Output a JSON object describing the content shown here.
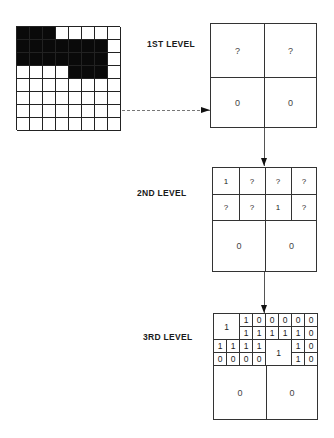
{
  "labels": {
    "level1": "1ST LEVEL",
    "level2": "2ND LEVEL",
    "level3": "3RD LEVEL"
  },
  "image_grid": {
    "rows": 8,
    "cols": 8,
    "pixels": [
      [
        1,
        1,
        1,
        0,
        0,
        0,
        0,
        0
      ],
      [
        1,
        1,
        1,
        1,
        1,
        1,
        1,
        0
      ],
      [
        1,
        1,
        1,
        1,
        1,
        1,
        1,
        0
      ],
      [
        0,
        0,
        0,
        0,
        1,
        1,
        1,
        0
      ],
      [
        0,
        0,
        0,
        0,
        0,
        0,
        0,
        0
      ],
      [
        0,
        0,
        0,
        0,
        0,
        0,
        0,
        0
      ],
      [
        0,
        0,
        0,
        0,
        0,
        0,
        0,
        0
      ],
      [
        0,
        0,
        0,
        0,
        0,
        0,
        0,
        0
      ]
    ]
  },
  "level1": {
    "cells": [
      "?",
      "?",
      "0",
      "0"
    ]
  },
  "level2": {
    "top": [
      [
        "1",
        "?",
        "?",
        "?"
      ],
      [
        "?",
        "?",
        "1",
        "?"
      ]
    ],
    "bottom": [
      "0",
      "0"
    ]
  },
  "level3": {
    "merged_top_left": "1",
    "merged_mid": "1",
    "q01": [
      [
        "1",
        "0"
      ],
      [
        "1",
        "1"
      ]
    ],
    "q02": [
      [
        "0",
        "0"
      ],
      [
        "1",
        "1"
      ]
    ],
    "q03": [
      [
        "0",
        "0"
      ],
      [
        "1",
        "0"
      ]
    ],
    "q10": [
      [
        "1",
        "1"
      ],
      [
        "0",
        "0"
      ]
    ],
    "q11": [
      [
        "1",
        "1"
      ],
      [
        "0",
        "0"
      ]
    ],
    "q13": [
      [
        "1",
        "0"
      ],
      [
        "1",
        "0"
      ]
    ],
    "bottom": [
      "0",
      "0"
    ]
  }
}
